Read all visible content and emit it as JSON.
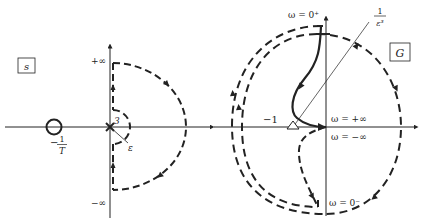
{
  "left_panel": {
    "plane_label": "s",
    "axis_labels": {
      "top": "+∞",
      "bottom": "−∞"
    },
    "zero_label_num": "1",
    "zero_label_den": "T",
    "zero_label_sign": "−",
    "pole_multiplicity": "3",
    "indent_radius_label": "ε"
  },
  "right_panel": {
    "plane_label": "G",
    "critical_point_label": "−1",
    "radius_label_num": "1",
    "radius_label_den": "ε³",
    "omega_labels": {
      "zero_plus": "ω = 0⁺",
      "plus_inf": "ω = +∞",
      "minus_inf": "ω = −∞",
      "zero_minus": "ω = 0⁻"
    }
  },
  "colors": {
    "ink": "#222222",
    "background": "#ffffff"
  }
}
